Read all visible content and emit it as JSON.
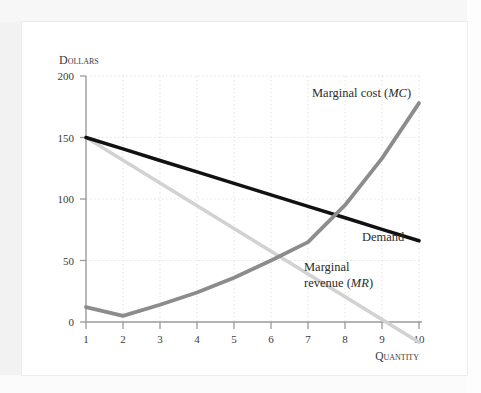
{
  "figure": {
    "axes": {
      "y_title": "Dollars",
      "x_title": "Quantity",
      "y_ticks": [
        "0",
        "50",
        "100",
        "150",
        "200"
      ],
      "x_ticks": [
        "1",
        "2",
        "3",
        "4",
        "5",
        "6",
        "7",
        "8",
        "9",
        "10"
      ]
    },
    "labels": {
      "marginal_cost": "Marginal cost (MC)",
      "marginal_cost_plain": "Marginal cost",
      "marginal_cost_abbr": "MC",
      "demand": "Demand",
      "marginal_revenue_line1": "Marginal",
      "marginal_revenue_line2": "revenue (MR)",
      "marginal_revenue_plain": "revenue",
      "marginal_revenue_abbr": "MR"
    },
    "colors": {
      "demand": "#111111",
      "marginal_cost": "#8c8c8c",
      "marginal_revenue": "#d2d2d2",
      "axis": "#9a9a9a",
      "grid": "#e2e2e2",
      "text": "#3a3a3a",
      "plate_background": "#ffffff",
      "page_background": "#f2f2f3"
    }
  },
  "chart_data": {
    "type": "line",
    "title": "",
    "xlabel": "Quantity",
    "ylabel": "Dollars",
    "xlim": [
      1,
      10
    ],
    "ylim": [
      0,
      200
    ],
    "yticks": [
      0,
      50,
      100,
      150,
      200
    ],
    "xticks": [
      1,
      2,
      3,
      4,
      5,
      6,
      7,
      8,
      9,
      10
    ],
    "grid": true,
    "legend": "inline-annotations",
    "x": [
      1,
      2,
      3,
      4,
      5,
      6,
      7,
      8,
      9,
      10
    ],
    "series": [
      {
        "name": "Demand",
        "color": "#111111",
        "values": [
          150,
          140.7,
          131.3,
          122,
          112.7,
          103.3,
          94,
          84.7,
          75.3,
          66
        ]
      },
      {
        "name": "Marginal revenue (MR)",
        "color": "#d2d2d2",
        "values": [
          150,
          131.5,
          113,
          94.5,
          76,
          57.5,
          39,
          20.5,
          2,
          -16.5
        ]
      },
      {
        "name": "Marginal cost (MC)",
        "color": "#8c8c8c",
        "values": [
          12,
          5,
          14,
          24,
          36,
          50,
          65,
          95,
          133,
          178
        ]
      }
    ],
    "annotations": [
      {
        "text": "Marginal cost (MC)",
        "x": 7.6,
        "y": 182
      },
      {
        "text": "Demand",
        "x": 9.0,
        "y": 62
      },
      {
        "text": "Marginal revenue (MR)",
        "x": 8.0,
        "y": 40
      }
    ]
  }
}
